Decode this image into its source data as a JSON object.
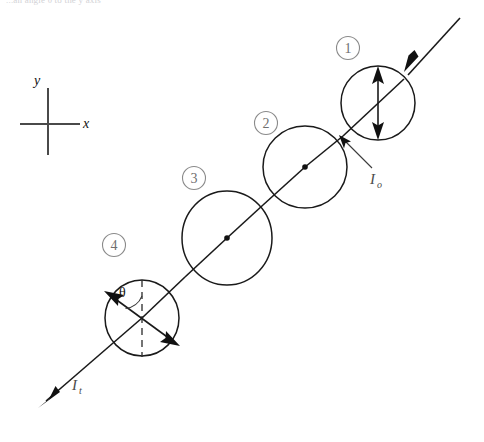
{
  "figure": {
    "title_fragment": "...an angle θ to the y axis",
    "background_color": "#ffffff",
    "ink_color": "#111111",
    "badge_color": "#6f6f6f"
  },
  "axes": {
    "x_label": "x",
    "y_label": "y",
    "origin": [
      48,
      124
    ],
    "x_extent": [
      20,
      80
    ],
    "y_extent": [
      88,
      155
    ]
  },
  "labels": {
    "incident_intensity": "I",
    "incident_intensity_sub": "o",
    "transmitted_intensity": "I",
    "transmitted_intensity_sub": "t",
    "angle": "θ"
  },
  "badges": [
    {
      "id": "badge-1",
      "text": "1",
      "cx": 348,
      "cy": 48
    },
    {
      "id": "badge-2",
      "text": "2",
      "cx": 266,
      "cy": 123
    },
    {
      "id": "badge-3",
      "text": "3",
      "cx": 194,
      "cy": 178
    },
    {
      "id": "badge-4",
      "text": "4",
      "cx": 114,
      "cy": 245
    }
  ],
  "polarizers": [
    {
      "id": "polarizer-1",
      "badge": "1",
      "cx": 378,
      "cy": 103,
      "rx": 37,
      "ry": 37,
      "axis_orientation": "vertical",
      "has_center_dot": false,
      "arrow": {
        "x1": 378,
        "y1": 70,
        "x2": 378,
        "y2": 136,
        "double_headed": true
      }
    },
    {
      "id": "polarizer-2",
      "badge": "2",
      "cx": 305,
      "cy": 167,
      "rx": 42,
      "ry": 41,
      "axis_orientation": "out-of-plane",
      "has_center_dot": true,
      "arrow": null
    },
    {
      "id": "polarizer-3",
      "badge": "3",
      "cx": 227,
      "cy": 238,
      "rx": 45,
      "ry": 47,
      "axis_orientation": "out-of-plane",
      "has_center_dot": true,
      "arrow": null
    },
    {
      "id": "polarizer-4",
      "badge": "4",
      "cx": 142,
      "cy": 318,
      "rx": 37,
      "ry": 38,
      "axis_orientation": "tilted",
      "has_center_dot": false,
      "dashed_reference": {
        "x1": 142,
        "y1": 281,
        "x2": 142,
        "y2": 356
      },
      "arrow": {
        "x1": 108,
        "y1": 294,
        "x2": 176,
        "y2": 343,
        "double_headed": true
      },
      "angle_arc": {
        "label": "θ",
        "label_x": 125,
        "label_y": 294
      }
    }
  ],
  "beam": {
    "entry_point": [
      460,
      18
    ],
    "exit_point": [
      38,
      408
    ],
    "incoming_arrow_tip": [
      418,
      57
    ],
    "outgoing_arrow_tip": [
      38,
      408
    ],
    "label_o_position": [
      376,
      180
    ],
    "label_t_position": [
      77,
      389
    ]
  }
}
